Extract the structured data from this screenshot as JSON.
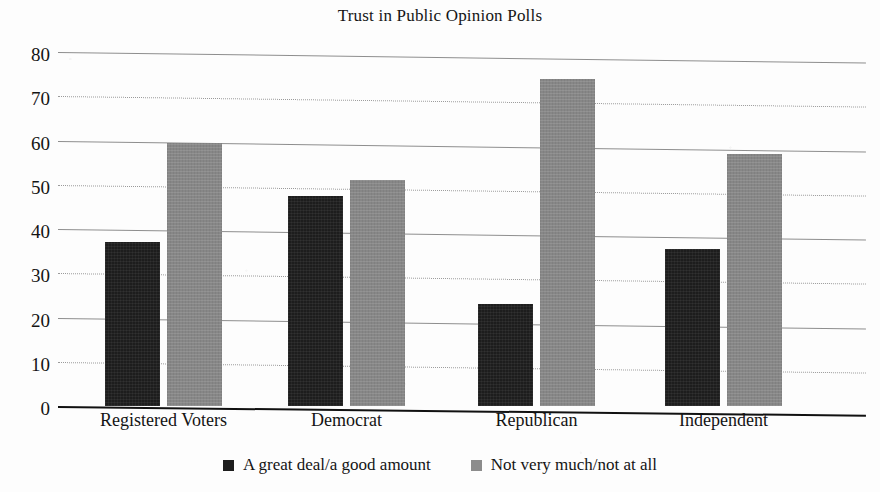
{
  "chart_data": {
    "type": "bar",
    "title": "Trust in Public Opinion Polls",
    "xlabel": "",
    "ylabel": "",
    "ylim": [
      0,
      80
    ],
    "yticks": [
      0,
      10,
      20,
      30,
      40,
      50,
      60,
      70,
      80
    ],
    "ytick_labels": [
      "0",
      "10",
      "20",
      "30",
      "40",
      "50",
      "60",
      "70",
      "80"
    ],
    "grid": true,
    "legend_position": "bottom",
    "categories": [
      "Registered Voters",
      "Democrat",
      "Republican",
      "Independent"
    ],
    "series": [
      {
        "name": "A great deal/a good amount",
        "color": "#1d1d1d",
        "values": [
          37,
          47.5,
          23,
          35.5
        ]
      },
      {
        "name": "Not very much/not at all",
        "color": "#878787",
        "values": [
          59.5,
          51,
          74,
          57
        ]
      }
    ]
  },
  "legend": {
    "items": [
      {
        "label": "A great deal/a good amount",
        "swatch": "dark-square-icon"
      },
      {
        "label": "Not very much/not at all",
        "swatch": "gray-square-icon"
      }
    ]
  },
  "colors": {
    "series_dark": "#1d1d1d",
    "series_gray": "#878787",
    "axis": "#111111",
    "gridline": "#8e8e8e",
    "text": "#141414",
    "background": "#fdfdfd"
  }
}
